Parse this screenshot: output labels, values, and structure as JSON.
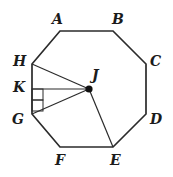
{
  "figure": {
    "type": "geometry-diagram",
    "shape": "regular-octagon",
    "background_color": "#ffffff",
    "stroke_color": "#2b2b2b",
    "label_color": "#1b1b1b",
    "center_point_color": "#111111",
    "canvas": {
      "width": 173,
      "height": 177
    },
    "vertices": [
      {
        "id": "A",
        "label": "A",
        "x": 60,
        "y": 31,
        "label_x": 52,
        "label_y": 12
      },
      {
        "id": "B",
        "label": "B",
        "x": 113,
        "y": 31,
        "label_x": 112,
        "label_y": 12
      },
      {
        "id": "C",
        "label": "C",
        "x": 146,
        "y": 64,
        "label_x": 150,
        "label_y": 54
      },
      {
        "id": "D",
        "label": "D",
        "x": 146,
        "y": 114,
        "label_x": 150,
        "label_y": 112
      },
      {
        "id": "E",
        "label": "E",
        "x": 113,
        "y": 147,
        "label_x": 110,
        "label_y": 153
      },
      {
        "id": "F",
        "label": "F",
        "x": 60,
        "y": 147,
        "label_x": 55,
        "label_y": 153
      },
      {
        "id": "G",
        "label": "G",
        "x": 32,
        "y": 114,
        "label_x": 12,
        "label_y": 112
      },
      {
        "id": "H",
        "label": "H",
        "x": 32,
        "y": 64,
        "label_x": 13,
        "label_y": 54
      }
    ],
    "interior_points": [
      {
        "id": "J",
        "label": "J",
        "x": 89,
        "y": 89,
        "label_x": 92,
        "label_y": 68,
        "dot_radius": 3.6
      },
      {
        "id": "K",
        "label": "K",
        "x": 32,
        "y": 89,
        "label_x": 13,
        "label_y": 80,
        "dot_radius": 0
      }
    ],
    "segments": [
      {
        "name": "segment-J-H",
        "from": "J",
        "to": "H"
      },
      {
        "name": "segment-J-K",
        "from": "J",
        "to": "K"
      },
      {
        "name": "segment-J-G",
        "from": "J",
        "to": "G"
      },
      {
        "name": "segment-J-E",
        "from": "J",
        "to": "E"
      }
    ],
    "right_angle_markers": [
      {
        "name": "right-angle-marker-at-K",
        "x": 32,
        "y": 89,
        "size": 11
      },
      {
        "name": "right-angle-marker-lower",
        "x": 32,
        "y": 100,
        "size": 11
      }
    ],
    "stroke_width_outline": 1.7,
    "stroke_width_inner": 1.2,
    "stroke_width_marker": 1.0
  }
}
